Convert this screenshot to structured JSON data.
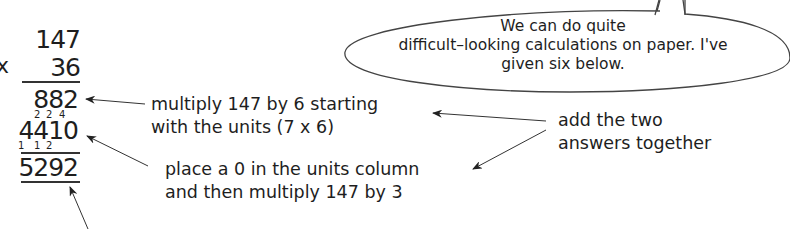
{
  "speech_bubble": {
    "lines": [
      "We can do quite",
      "difficult–looking calculations on paper.  I've",
      "given six below."
    ]
  },
  "calculation": {
    "operator": "x",
    "multiplicand": "147",
    "multiplier": "36",
    "partial_product_1": "882",
    "partial_product_2": "4410",
    "carries_top": [
      "2",
      "2",
      "4"
    ],
    "carries_bottom": [
      "1",
      "1",
      "2"
    ],
    "result": "5292"
  },
  "annotations": {
    "step1": [
      "multiply 147 by 6 starting",
      "with the units (7 x  6)"
    ],
    "step2": [
      "place a 0 in the units column",
      "and then multiply 147 by 3"
    ],
    "step3": [
      "add the two",
      "answers together"
    ]
  },
  "colors": {
    "ink": "#1e1e1e",
    "background": "#ffffff"
  }
}
